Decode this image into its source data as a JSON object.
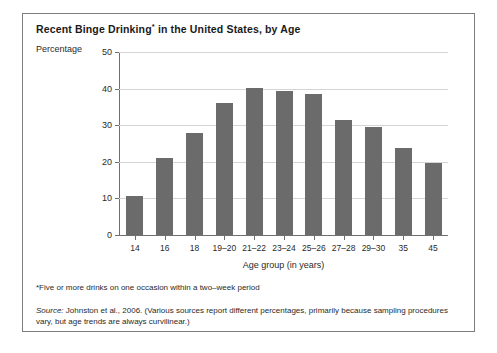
{
  "figure": {
    "title_main": "Recent Binge Drinking",
    "title_marker": "*",
    "title_rest": " in the United States, by Age",
    "footnote": "*Five or more drinks on one occasion within a two–week period",
    "source_label": "Source:",
    "source_text": " Johnston et al., 2006. (Various sources report different percentages, primarily because sampling procedures vary, but age trends are always curvilinear.)",
    "border_color": "#7d7d7d"
  },
  "chart_data": {
    "type": "bar",
    "title": "Recent Binge Drinking* in the United States, by Age",
    "xlabel": "Age group (in years)",
    "ylabel": "Percentage",
    "categories": [
      "14",
      "16",
      "18",
      "19–20",
      "21–22",
      "23–24",
      "25–26",
      "27–28",
      "29–30",
      "35",
      "45"
    ],
    "values": [
      10.7,
      21.0,
      28.0,
      36.0,
      40.3,
      39.3,
      38.5,
      31.5,
      29.5,
      23.7,
      19.7
    ],
    "ylim": [
      0,
      50
    ],
    "yticks": [
      0,
      10,
      20,
      30,
      40,
      50
    ],
    "ytick_labels": [
      "0",
      "10",
      "20",
      "30",
      "40",
      "50"
    ],
    "grid": true,
    "legend": "none",
    "bar_color": "#6b6b6b",
    "gridline_color": "#d5d5d5",
    "axis_color": "#6f6f6f"
  }
}
